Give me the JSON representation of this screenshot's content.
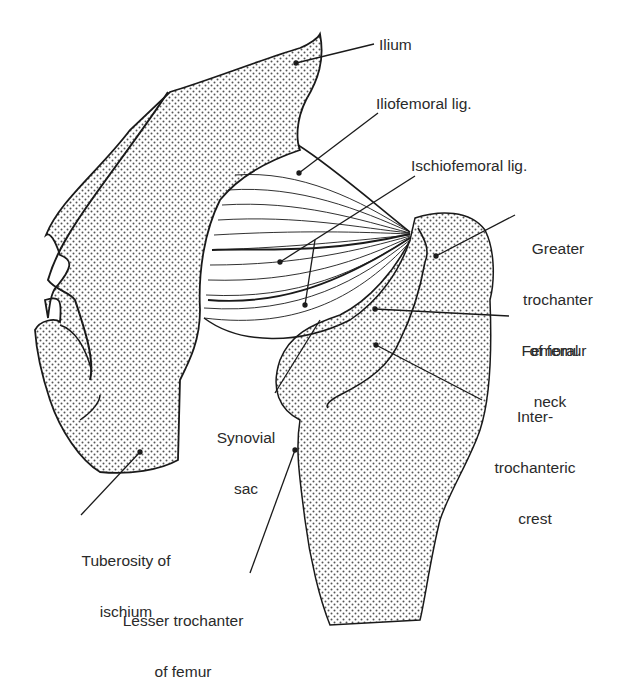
{
  "figure": {
    "type": "anatomical line drawing"
  },
  "labels": {
    "ilium": "Ilium",
    "iliofemoral": "Iliofemoral lig.",
    "ischiofemoral": "Ischiofemoral lig.",
    "greater_trochanter": [
      "Greater",
      "trochanter",
      "of femur"
    ],
    "femoral_neck": [
      "Femoral",
      "neck"
    ],
    "intertrochanteric": [
      "Inter-",
      "trochanteric",
      "crest"
    ],
    "synovial_sac": [
      "Synovial",
      "sac"
    ],
    "tuberosity": [
      "Tuberosity of",
      "ischium"
    ],
    "lesser_trochanter": [
      "Lesser trochanter",
      "of femur"
    ]
  },
  "colors": {
    "ink": "#1a1a1a",
    "stipple": "#555555",
    "background": "#ffffff"
  }
}
